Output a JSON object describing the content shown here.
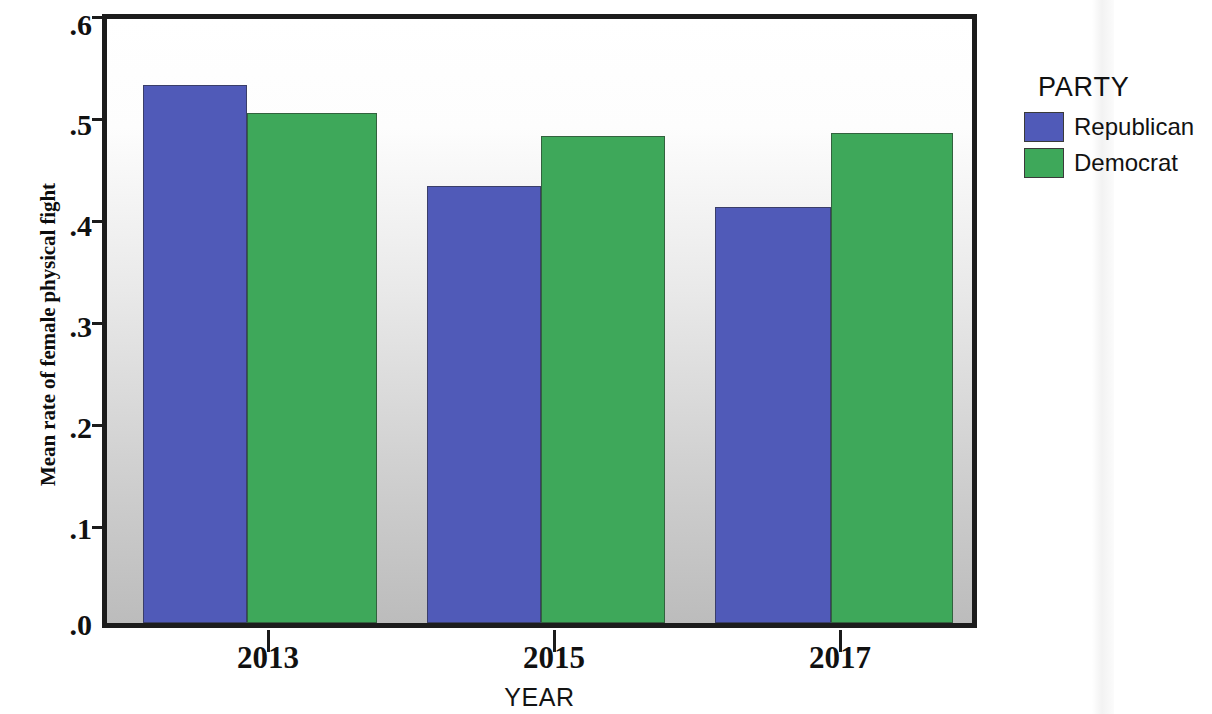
{
  "chart_data": {
    "type": "bar",
    "title": "",
    "xlabel": "YEAR",
    "ylabel": "Mean rate of female physical fight",
    "categories": [
      "2013",
      "2015",
      "2017"
    ],
    "series": [
      {
        "name": "Republican",
        "color": "#505ab8",
        "values": [
          0.534,
          0.434,
          0.413
        ]
      },
      {
        "name": "Democrat",
        "color": "#3ea85a",
        "values": [
          0.507,
          0.484,
          0.487
        ]
      }
    ],
    "ylim": [
      0.0,
      0.6
    ],
    "ytick_labels": [
      ".0",
      ".1",
      ".2",
      ".3",
      ".4",
      ".5",
      ".6"
    ],
    "ytick_values": [
      0.0,
      0.1,
      0.2,
      0.3,
      0.4,
      0.5,
      0.6
    ],
    "grid": false,
    "legend": {
      "title": "PARTY",
      "position": "right",
      "entries": [
        {
          "label": "Republican",
          "color": "#505ab8"
        },
        {
          "label": "Democrat",
          "color": "#3ea85a"
        }
      ]
    }
  },
  "axis": {
    "y_title": "Mean rate of female physical fight",
    "x_title": "YEAR",
    "y_ticks": [
      {
        "label": ".6"
      },
      {
        "label": ".5"
      },
      {
        "label": ".4"
      },
      {
        "label": ".3"
      },
      {
        "label": ".2"
      },
      {
        "label": ".1"
      },
      {
        "label": ".0"
      }
    ],
    "x_ticks": [
      {
        "label": "2013"
      },
      {
        "label": "2015"
      },
      {
        "label": "2017"
      }
    ]
  },
  "legend": {
    "title": "PARTY",
    "items": [
      {
        "label": "Republican"
      },
      {
        "label": "Democrat"
      }
    ]
  }
}
